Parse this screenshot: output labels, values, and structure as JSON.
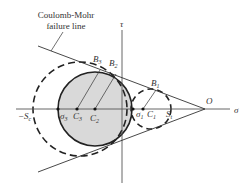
{
  "diagram": {
    "annotation": {
      "line1": "Coulomb-Mohr",
      "line2": "failure line"
    },
    "axes": {
      "horizontal_label": "σ",
      "vertical_label": "τ",
      "origin_label": "O"
    },
    "points": {
      "neg_Sc": {
        "main": "−S",
        "sub": "c"
      },
      "sigma3": {
        "main": "σ",
        "sub": "3"
      },
      "C3": {
        "main": "C",
        "sub": "3"
      },
      "C2": {
        "main": "C",
        "sub": "2"
      },
      "sigma1": {
        "main": "σ",
        "sub": "1"
      },
      "C1": {
        "main": "C",
        "sub": "1"
      },
      "St": {
        "main": "S",
        "sub": "t"
      },
      "B3": {
        "main": "B",
        "sub": "3"
      },
      "B2": {
        "main": "B",
        "sub": "2"
      },
      "B1": {
        "main": "B",
        "sub": "1"
      }
    },
    "colors": {
      "stroke": "#222222",
      "axis": "#555555",
      "fill_circle": "#d9d9d9",
      "background": "#ffffff"
    }
  }
}
